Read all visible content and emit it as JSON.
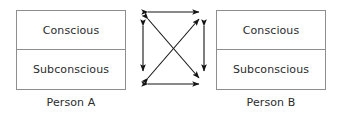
{
  "figure": {
    "background_color": "#ffffff",
    "border_color": "#8e8e8e",
    "text_color": "#2b2b2b",
    "arrow_color": "#141414"
  },
  "persons": [
    {
      "id": "person-a",
      "caption": "Person A",
      "layers": [
        {
          "id": "conscious",
          "label": "Conscious"
        },
        {
          "id": "subconscious",
          "label": "Subconscious"
        }
      ]
    },
    {
      "id": "person-b",
      "caption": "Person B",
      "layers": [
        {
          "id": "conscious",
          "label": "Conscious"
        },
        {
          "id": "subconscious",
          "label": "Subconscious"
        }
      ]
    }
  ],
  "connections": {
    "style": "double-headed",
    "count": 6,
    "nodes": [
      {
        "id": "a-conscious",
        "x": 16,
        "y": 16
      },
      {
        "id": "b-conscious",
        "x": 79,
        "y": 16
      },
      {
        "id": "a-subconscious",
        "x": 16,
        "y": 85
      },
      {
        "id": "b-subconscious",
        "x": 79,
        "y": 85
      }
    ],
    "edges": [
      {
        "id": "top",
        "from": "a-conscious",
        "to": "b-conscious"
      },
      {
        "id": "bottom",
        "from": "a-subconscious",
        "to": "b-subconscious"
      },
      {
        "id": "left",
        "from": "a-conscious",
        "to": "a-subconscious"
      },
      {
        "id": "right",
        "from": "b-conscious",
        "to": "b-subconscious"
      },
      {
        "id": "diagonal-down",
        "from": "a-conscious",
        "to": "b-subconscious"
      },
      {
        "id": "diagonal-up",
        "from": "a-subconscious",
        "to": "b-conscious"
      }
    ]
  }
}
